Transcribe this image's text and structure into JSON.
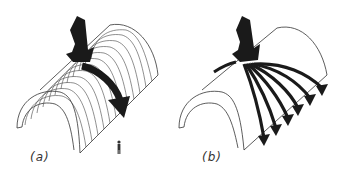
{
  "figure": {
    "panels": [
      {
        "id": "a",
        "label": "(a)",
        "description": "Ribbed barrel vault; load carried by transverse arch ribs",
        "rib_count": 13,
        "load_arrow": "single curved arrow along arch",
        "scale_figure": "person"
      },
      {
        "id": "b",
        "label": "(b)",
        "description": "Smooth shell barrel vault; load spreads through shell in fanned paths",
        "load_paths": 6,
        "load_arrow": "fanned curved arrows"
      }
    ],
    "colors": {
      "line": "#333333",
      "arrow": "#1a1a1a",
      "background": "#ffffff"
    }
  }
}
